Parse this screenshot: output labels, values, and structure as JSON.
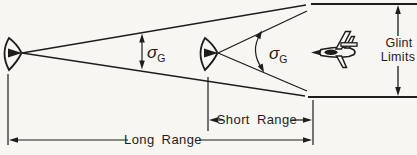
{
  "figure": {
    "description_visible_text_only": true,
    "colors": {
      "ink": "#1e1d1b",
      "paper": "#f7f6f3"
    }
  },
  "labels": {
    "sigma_long": {
      "base": "σ",
      "sub": "G"
    },
    "sigma_short": {
      "base": "σ",
      "sub": "G"
    },
    "glint_limits": {
      "line1": "Glint",
      "line2": "Limits"
    },
    "short_range": "Short Range",
    "long_range": "Long Range"
  },
  "icons": {
    "radar_long_range": "radar-antenna-icon",
    "radar_short_range": "radar-antenna-icon",
    "target": "aircraft-icon"
  }
}
